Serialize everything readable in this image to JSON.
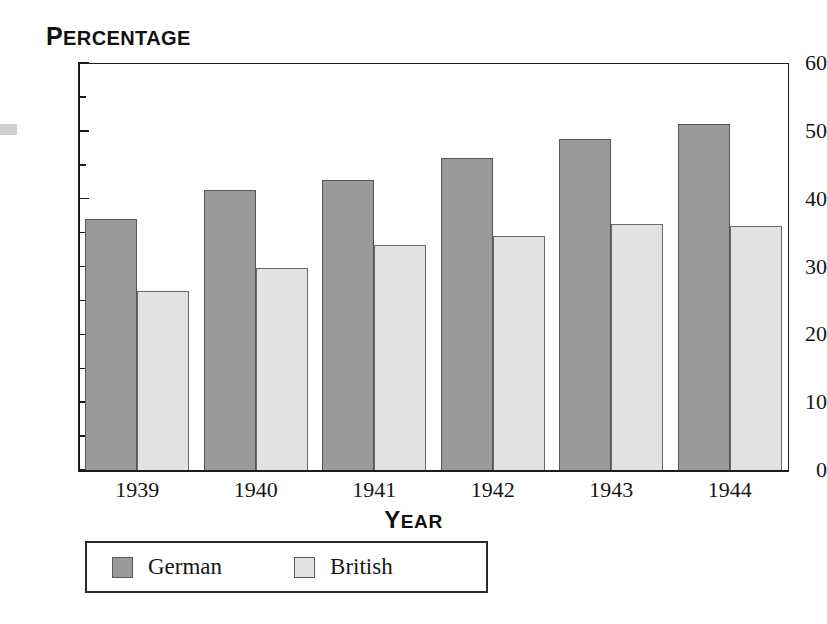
{
  "artifact": {
    "name": "page-edge-scan-mark"
  },
  "chart_data": {
    "type": "bar",
    "title": "",
    "xlabel": "Year",
    "ylabel": "Percentage",
    "categories": [
      "1939",
      "1940",
      "1941",
      "1942",
      "1943",
      "1944"
    ],
    "series": [
      {
        "name": "German",
        "color": "#9a9a9a",
        "values": [
          37.0,
          41.3,
          42.8,
          46.0,
          48.8,
          51.0
        ]
      },
      {
        "name": "British",
        "color": "#e2e2e2",
        "values": [
          26.4,
          29.8,
          33.2,
          34.5,
          36.2,
          36.0
        ]
      }
    ],
    "ylim": [
      0,
      60
    ],
    "y_major_ticks": [
      0,
      10,
      20,
      30,
      40,
      50,
      60
    ],
    "y_minor_ticks": [
      5,
      15,
      25,
      35,
      45,
      55
    ],
    "y_tick_labels": [
      "0",
      "10",
      "20",
      "30",
      "40",
      "50",
      "60"
    ],
    "grid": false,
    "legend_position": "below-axis-left"
  },
  "axis_titles": {
    "y_first": "P",
    "y_rest": "ERCENTAGE",
    "x_first": "Y",
    "x_rest": "EAR"
  },
  "legend": {
    "entries": [
      {
        "label": "German",
        "color": "#9a9a9a"
      },
      {
        "label": "British",
        "color": "#e2e2e2"
      }
    ]
  }
}
